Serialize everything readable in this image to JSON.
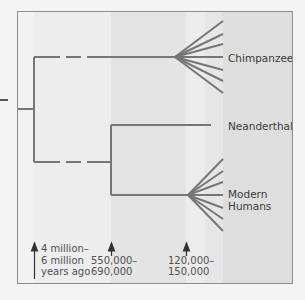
{
  "diagram": {
    "type": "phylogenetic-tree",
    "colors": {
      "line": "#757575",
      "frame": "#8c8c8c",
      "text": "#3a3a3a",
      "band_light": "#f1f1f1",
      "band_mid": "#e6e6e6",
      "band_dark": "#dcdcdc"
    },
    "taxa": [
      {
        "id": "chimpanzees",
        "label": "Chimpanzees"
      },
      {
        "id": "neanderthals",
        "label": "Neanderthals"
      },
      {
        "id": "modern-humans",
        "label_line1": "Modern",
        "label_line2": "Humans"
      }
    ],
    "time_markers": [
      {
        "line1": "4 million–",
        "line2": "6 million",
        "line3": "years ago"
      },
      {
        "line1": "550,000–",
        "line2": "690,000"
      },
      {
        "line1": "120,000–",
        "line2": "150,000"
      }
    ]
  }
}
